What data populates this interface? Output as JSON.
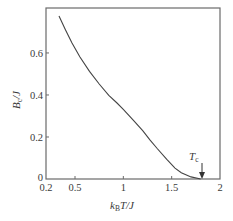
{
  "chart_data": {
    "type": "line",
    "title": "",
    "xlabel": "k_B T/J",
    "ylabel": "B_c/J",
    "xlim": [
      0.2,
      2.0
    ],
    "ylim": [
      0,
      0.814
    ],
    "grid": false,
    "legend": null,
    "x_ticks": [
      0.2,
      0.5,
      1,
      1.5,
      2
    ],
    "x_tick_labels": [
      "0.2",
      "0.5",
      "1",
      "1.5",
      "2"
    ],
    "y_ticks": [
      0,
      0.2,
      0.4,
      0.6
    ],
    "y_tick_labels": [
      "0",
      "0.2",
      "0.4",
      "0.6"
    ],
    "series": [
      {
        "name": "B_c/J",
        "x": [
          0.334,
          0.4,
          0.469,
          0.55,
          0.65,
          0.75,
          0.85,
          0.934,
          1.0,
          1.1,
          1.2,
          1.275,
          1.35,
          1.45,
          1.534,
          1.6,
          1.7,
          1.8
        ],
        "y": [
          0.776,
          0.712,
          0.648,
          0.582,
          0.512,
          0.452,
          0.398,
          0.362,
          0.332,
          0.282,
          0.23,
          0.186,
          0.145,
          0.094,
          0.052,
          0.03,
          0.01,
          0.0
        ]
      }
    ],
    "annotations": [
      {
        "text": "T_c",
        "x": 1.81,
        "y": 0,
        "arrow": "down"
      }
    ]
  },
  "labels": {
    "xlabel_main": "k",
    "xlabel_sub": "B",
    "xlabel_rest": "T/J",
    "ylabel_main": "B",
    "ylabel_sub": "c",
    "ylabel_rest": "/J",
    "tc_main": "T",
    "tc_sub": "c"
  }
}
